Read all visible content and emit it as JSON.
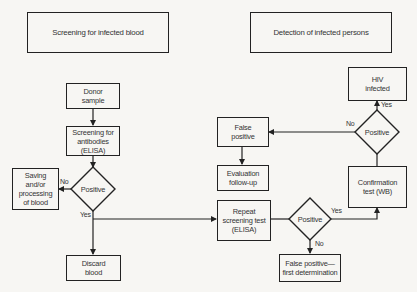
{
  "headers": {
    "left": "Screening for infected blood",
    "right": "Detection of infected persons"
  },
  "nodes": {
    "donor_sample": "Donor sample",
    "screening_elisa": "Screening for antibodies (ELISA)",
    "decision_1": "Positive",
    "saving_processing": "Saving and/or processing of blood",
    "discard_blood": "Discard blood",
    "repeat_screening": "Repeat screening test (ELISA)",
    "decision_2": "Positive",
    "false_positive_first": "False positive— first determination",
    "confirmation_test": "Confirmation test (WB)",
    "decision_3": "Positive",
    "hiv_infected": "HIV infected",
    "false_positive": "False positive",
    "evaluation_followup": "Evaluation follow-up"
  },
  "edge_labels": {
    "d1_no": "No",
    "d1_yes": "Yes",
    "d2_yes": "Yes",
    "d2_no": "No",
    "d3_yes": "Yes",
    "d3_no": "No"
  }
}
